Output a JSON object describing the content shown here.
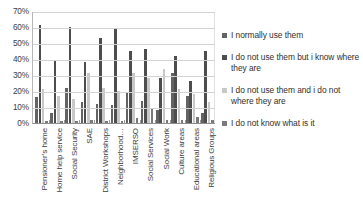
{
  "chart_data": {
    "type": "bar",
    "title": "",
    "xlabel": "",
    "ylabel": "",
    "ylim": [
      0,
      70
    ],
    "grid": true,
    "legend_position": "right",
    "y_ticks": [
      "0%",
      "10%",
      "20%",
      "30%",
      "40%",
      "50%",
      "60%",
      "70%"
    ],
    "y_tick_values": [
      0,
      10,
      20,
      30,
      40,
      50,
      60,
      70
    ],
    "categories": [
      "Pensioner’s home",
      "Home help service",
      "Social Security",
      "SAE",
      "District Workshops",
      "Neighborhood…",
      "IMSERSO",
      "Social Services",
      "Social Work",
      "Culture areas",
      "Educational areas",
      "Religious Groups"
    ],
    "series": [
      {
        "name": "I normally use them",
        "color": "#636363",
        "values": [
          16,
          6,
          22,
          13,
          12,
          11,
          19,
          14,
          8,
          31,
          17,
          6
        ]
      },
      {
        "name": "I do not use them but i know where they are",
        "color": "#4d4d4d",
        "values": [
          61,
          39,
          60,
          38,
          53,
          59,
          45,
          46,
          28,
          42,
          26,
          45
        ]
      },
      {
        "name": "I do not use them and i do not where they are",
        "color": "#c8c8c8",
        "values": [
          21,
          17,
          15,
          31,
          22,
          20,
          31,
          28,
          34,
          21,
          18,
          13
        ]
      },
      {
        "name": "I do not know what is it",
        "color": "#7a7a7a",
        "values": [
          1,
          1,
          1,
          2,
          1,
          1,
          3,
          9,
          2,
          2,
          4,
          2
        ]
      }
    ]
  },
  "legend": {
    "items": [
      {
        "label": "I normally use them"
      },
      {
        "label": "I do not use them but i know where they are"
      },
      {
        "label": "I do not use them and i do not where they are"
      },
      {
        "label": "I do not know what is it"
      }
    ]
  }
}
